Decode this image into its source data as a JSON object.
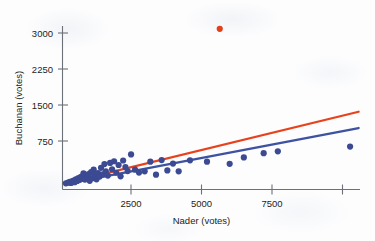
{
  "chart_data": {
    "type": "scatter",
    "title": "",
    "xlabel": "Nader (votes)",
    "ylabel": "Buchanan (votes)",
    "xlim": [
      0,
      10500
    ],
    "ylim": [
      -120,
      3350
    ],
    "xticks": [
      2500,
      5000,
      7500,
      10000
    ],
    "xtick_labels": [
      "2500",
      "5000",
      "7500",
      ""
    ],
    "yticks": [
      750,
      1500,
      2250,
      3000
    ],
    "ytick_labels": [
      "750",
      "1500",
      "2250",
      "3000"
    ],
    "grid": false,
    "legend": "none",
    "point_color": "#3b4a92",
    "outlier_color": "#e2401b",
    "upper_line_color": "#e8421d",
    "lower_line_color": "#3d52a0",
    "axis_color": "#6c7077",
    "series": [
      {
        "name": "Florida counties",
        "marker": "filled-circle",
        "color": "#3b4a92",
        "points": [
          [
            120,
            12
          ],
          [
            200,
            25
          ],
          [
            260,
            40
          ],
          [
            300,
            18
          ],
          [
            340,
            55
          ],
          [
            390,
            70
          ],
          [
            430,
            35
          ],
          [
            470,
            95
          ],
          [
            520,
            60
          ],
          [
            560,
            120
          ],
          [
            610,
            85
          ],
          [
            650,
            150
          ],
          [
            700,
            110
          ],
          [
            740,
            225
          ],
          [
            790,
            90
          ],
          [
            830,
            175
          ],
          [
            880,
            140
          ],
          [
            920,
            205
          ],
          [
            960,
            65
          ],
          [
            1010,
            250
          ],
          [
            1060,
            120
          ],
          [
            1100,
            300
          ],
          [
            1150,
            185
          ],
          [
            1200,
            95
          ],
          [
            1250,
            230
          ],
          [
            1310,
            155
          ],
          [
            1360,
            340
          ],
          [
            1420,
            200
          ],
          [
            1480,
            420
          ],
          [
            1530,
            265
          ],
          [
            1600,
            175
          ],
          [
            1680,
            445
          ],
          [
            1750,
            310
          ],
          [
            1820,
            480
          ],
          [
            1900,
            235
          ],
          [
            1980,
            400
          ],
          [
            2050,
            160
          ],
          [
            2140,
            495
          ],
          [
            2220,
            355
          ],
          [
            2300,
            270
          ],
          [
            2420,
            625
          ],
          [
            2560,
            300
          ],
          [
            2700,
            240
          ],
          [
            2900,
            265
          ],
          [
            3100,
            470
          ],
          [
            3300,
            195
          ],
          [
            3500,
            505
          ],
          [
            3700,
            285
          ],
          [
            3900,
            430
          ],
          [
            4100,
            265
          ],
          [
            4500,
            500
          ],
          [
            5100,
            470
          ],
          [
            5900,
            425
          ],
          [
            6400,
            560
          ],
          [
            7100,
            650
          ],
          [
            7600,
            690
          ],
          [
            10150,
            790
          ]
        ]
      },
      {
        "name": "Palm Beach County outlier",
        "marker": "filled-circle",
        "color": "#e2401b",
        "points": [
          [
            5550,
            3290
          ]
        ]
      }
    ],
    "lines": [
      {
        "name": "regression-with-outlier",
        "color": "#e8421d",
        "x": [
          150,
          10450
        ],
        "y": [
          20,
          1530
        ]
      },
      {
        "name": "regression-without-outlier",
        "color": "#3d52a0",
        "x": [
          150,
          10450
        ],
        "y": [
          5,
          1185
        ]
      }
    ]
  },
  "axes": {
    "y_title": "Buchanan (votes)",
    "x_title": "Nader (votes)",
    "y_tick_labels": [
      "3000",
      "2250",
      "1500",
      "750"
    ],
    "x_tick_labels": [
      "2500",
      "5000",
      "7500"
    ]
  }
}
